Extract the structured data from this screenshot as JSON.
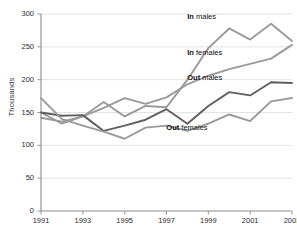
{
  "chart_data": {
    "type": "line",
    "title": "",
    "xlabel": "",
    "ylabel": "Thousands",
    "xlim": [
      1991,
      2003
    ],
    "ylim": [
      0,
      300
    ],
    "ytick_step": 50,
    "grid": true,
    "legend_position": "inline-annotations",
    "x": [
      1991,
      1992,
      1993,
      1994,
      1995,
      1996,
      1997,
      1998,
      1999,
      2000,
      2001,
      2002,
      2003
    ],
    "ytick_labels": [
      "0",
      "50",
      "100",
      "150",
      "200",
      "250",
      "300"
    ],
    "xtick_labels": [
      "1991",
      "1993",
      "1995",
      "1997",
      "1999",
      "2001",
      "2003"
    ],
    "xtick_values": [
      1991,
      1993,
      1995,
      1997,
      1999,
      2001,
      2003
    ],
    "series": [
      {
        "name": "In males",
        "label": "In males",
        "label_bold_prefix": "In",
        "label_rest": " males",
        "color": "#9a9a9a",
        "values": [
          142,
          136,
          144,
          166,
          144,
          160,
          158,
          200,
          248,
          278,
          261,
          285,
          259
        ]
      },
      {
        "name": "In females",
        "label": "In females",
        "label_bold_prefix": "In",
        "label_rest": " females",
        "color": "#9a9a9a",
        "values": [
          150,
          133,
          144,
          157,
          172,
          163,
          173,
          193,
          206,
          216,
          224,
          232,
          253
        ]
      },
      {
        "name": "Out males",
        "label": "Out males",
        "label_bold_prefix": "Out",
        "label_rest": " males",
        "color": "#5f5f5f",
        "values": [
          150,
          145,
          146,
          122,
          130,
          139,
          155,
          133,
          160,
          181,
          176,
          196,
          195
        ]
      },
      {
        "name": "Out females",
        "label": "Out females",
        "label_bold_prefix": "Out",
        "label_rest": " females",
        "color": "#9a9a9a",
        "values": [
          172,
          140,
          130,
          121,
          110,
          127,
          130,
          122,
          133,
          147,
          137,
          167,
          172
        ]
      }
    ],
    "annotations": [
      {
        "text": "In males",
        "x": 2000,
        "y": 296
      },
      {
        "text": "In females",
        "x": 2000,
        "y": 240
      },
      {
        "text": "Out males",
        "x": 2000,
        "y": 203
      },
      {
        "text": "Out females",
        "x": 1999,
        "y": 127
      }
    ]
  },
  "axes": {
    "y_axis_title": "Thousands"
  }
}
